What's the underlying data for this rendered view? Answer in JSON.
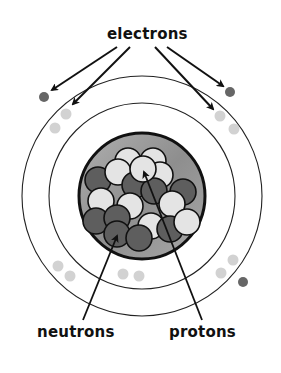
{
  "diagram": {
    "type": "atom-model",
    "labels": {
      "electrons": "electrons",
      "neutrons": "neutrons",
      "protons": "protons"
    },
    "colors": {
      "background": "#ffffff",
      "ring": "#222222",
      "nucleus_fill": "#9a9a9a",
      "neutron": "#5e5e5e",
      "proton": "#e4e4e4",
      "electron_outer": "#666666",
      "electron_inner": "#d2d2d2",
      "arrow": "#111111"
    },
    "rings": [
      {
        "name": "outer-shell",
        "cx": 142,
        "cy": 196,
        "r": 120
      },
      {
        "name": "inner-shell",
        "cx": 142,
        "cy": 196,
        "r": 93
      }
    ],
    "nucleus": {
      "cx": 142,
      "cy": 196,
      "r": 63
    }
  }
}
